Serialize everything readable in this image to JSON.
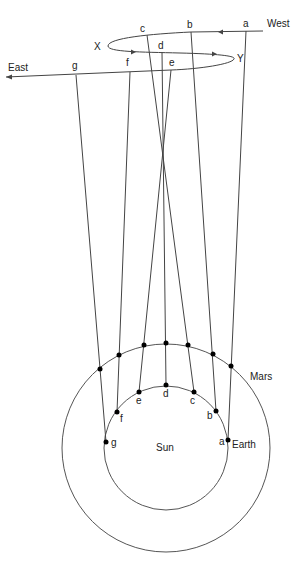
{
  "diagram": {
    "directions": {
      "west": "West",
      "east": "East"
    },
    "loop_labels": {
      "x": "X",
      "y": "Y"
    },
    "bodies": {
      "sun": "Sun",
      "earth": "Earth",
      "mars": "Mars"
    },
    "sky_positions": [
      {
        "label": "a",
        "x": 246,
        "y": 31
      },
      {
        "label": "b",
        "x": 191,
        "y": 32
      },
      {
        "label": "c",
        "x": 147,
        "y": 35
      },
      {
        "label": "d",
        "x": 162,
        "y": 52
      },
      {
        "label": "e",
        "x": 171,
        "y": 70
      },
      {
        "label": "f",
        "x": 130,
        "y": 72
      },
      {
        "label": "g",
        "x": 76,
        "y": 75
      }
    ],
    "earth_positions": [
      {
        "label": "a",
        "x": 228,
        "y": 440
      },
      {
        "label": "b",
        "x": 216,
        "y": 411
      },
      {
        "label": "c",
        "x": 194,
        "y": 392
      },
      {
        "label": "d",
        "x": 166,
        "y": 385
      },
      {
        "label": "e",
        "x": 139,
        "y": 392
      },
      {
        "label": "f",
        "x": 117,
        "y": 412
      },
      {
        "label": "g",
        "x": 106,
        "y": 442
      }
    ],
    "mars_positions": [
      {
        "x": 231,
        "y": 366
      },
      {
        "x": 213,
        "y": 354
      },
      {
        "x": 188,
        "y": 345
      },
      {
        "x": 166,
        "y": 343
      },
      {
        "x": 144,
        "y": 345
      },
      {
        "x": 119,
        "y": 355
      },
      {
        "x": 100,
        "y": 369
      }
    ]
  }
}
